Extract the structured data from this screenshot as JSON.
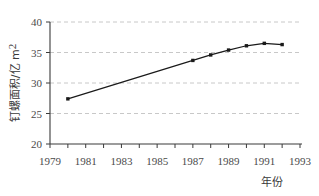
{
  "chart_data": {
    "type": "line",
    "title": "",
    "xlabel": "年份",
    "ylabel": "钉螺面积/亿 m²",
    "ylabel_main": "钉螺面积/亿 m",
    "ylabel_sup": "2",
    "x": [
      1980,
      1987,
      1988,
      1989,
      1990,
      1991,
      1992
    ],
    "values": [
      27.4,
      33.7,
      34.6,
      35.4,
      36.1,
      36.5,
      36.3
    ],
    "series": [
      {
        "name": "钉螺面积",
        "values": [
          27.4,
          33.7,
          34.6,
          35.4,
          36.1,
          36.5,
          36.3
        ]
      }
    ],
    "xlim": [
      1979,
      1993
    ],
    "ylim": [
      20,
      40
    ],
    "xticks": [
      1979,
      1980,
      1981,
      1982,
      1983,
      1984,
      1985,
      1986,
      1987,
      1988,
      1989,
      1990,
      1991,
      1992,
      1993
    ],
    "xtick_labels": [
      "1979",
      "1981",
      "1983",
      "1985",
      "1987",
      "1989",
      "1991",
      "1993"
    ],
    "xtick_label_values": [
      1979,
      1981,
      1983,
      1985,
      1987,
      1989,
      1991,
      1993
    ],
    "yticks": [
      20,
      25,
      30,
      35,
      40
    ],
    "ytick_labels": [
      "20",
      "25",
      "30",
      "35",
      "40"
    ],
    "grid": "horizontal-dashed",
    "grid_values": [
      25,
      30,
      35,
      40
    ],
    "legend": "none",
    "marker": "square",
    "line_color": "#1a1a1a",
    "marker_color": "#1a1a1a",
    "grid_color": "#c8c8c8",
    "axis_color": "#3a3a3a",
    "background": "#ffffff"
  }
}
